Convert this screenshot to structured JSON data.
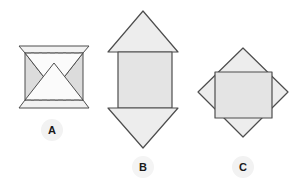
{
  "figure": {
    "background_color": "#ffffff",
    "stroke_color": "#4d4d4d",
    "fill_color": "#ededed",
    "fill_color_dark": "#e0e0e0",
    "dash_color": "#8c8c8c",
    "label_color": "#1a1a1a",
    "label_halo_color": "#f2f2f2",
    "items": [
      {
        "id": "A",
        "label": "A",
        "label_x": 52,
        "label_y": 130,
        "description": "bowtie net: two inward triangles between dashed fold lines with trapezoid flaps",
        "shapes": {
          "top_flap": "19,46 89,46 83,53 25,53",
          "bottom_flap": "25,100 83,100 89,108 19,108",
          "left_wing": "25,53 54,90 25,100",
          "right_wing": "83,53 54,90 83,100",
          "upper_triangle": "25,53 83,53 54,90",
          "lower_triangle": "25,100 83,100 54,63",
          "dash_top": "26,53 82,53",
          "dash_bottom": "26,100 82,100"
        }
      },
      {
        "id": "B",
        "label": "B",
        "label_x": 143,
        "label_y": 167,
        "description": "arrow net: up triangle, central rectangle, down triangle",
        "shapes": {
          "top_triangle": "108,52 143,11 178,52",
          "rectangle": "118,52 172,52 172,108 118,108",
          "bottom_triangle": "108,108 178,108 143,148"
        }
      },
      {
        "id": "C",
        "label": "C",
        "label_x": 243,
        "label_y": 167,
        "description": "diamond net: rotated square with inscribed axis-aligned square",
        "shapes": {
          "diamond": "243,48 288,92 243,137 198,92",
          "inner_square": "215,72 272,72 272,118 215,118"
        }
      }
    ]
  }
}
